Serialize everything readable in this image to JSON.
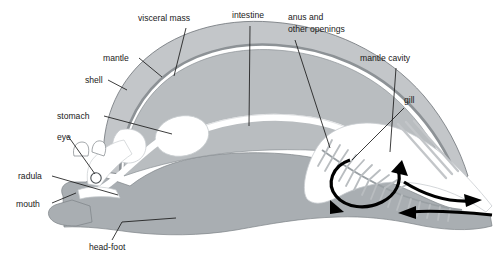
{
  "diagram": {
    "background_color": "#ffffff",
    "colors": {
      "shell": "#c3c6c9",
      "mantle_line": "#8d9296",
      "visceral_mass": "#b9bdc0",
      "body": "#a9aeb2",
      "cavity_white": "#ffffff",
      "outline": "#6f7478",
      "label_text": "#1a1a1a",
      "arrow": "#000000",
      "gill_filament": "#b9bdc0"
    },
    "labels": [
      {
        "id": "visceral-mass",
        "text": "visceral mass",
        "x": 138,
        "y": 21
      },
      {
        "id": "intestine",
        "text": "intestine",
        "x": 232,
        "y": 18
      },
      {
        "id": "anus",
        "text": "anus and",
        "x": 288,
        "y": 20
      },
      {
        "id": "anus2",
        "text": "other openings",
        "x": 288,
        "y": 32
      },
      {
        "id": "mantle-cavity",
        "text": "mantle cavity",
        "x": 360,
        "y": 61
      },
      {
        "id": "mantle",
        "text": "mantle",
        "x": 103,
        "y": 61
      },
      {
        "id": "shell",
        "text": "shell",
        "x": 85,
        "y": 83
      },
      {
        "id": "stomach",
        "text": "stomach",
        "x": 57,
        "y": 119
      },
      {
        "id": "gill",
        "text": "gill",
        "x": 404,
        "y": 103
      },
      {
        "id": "eye",
        "text": "eye",
        "x": 57,
        "y": 140
      },
      {
        "id": "radula",
        "text": "radula",
        "x": 18,
        "y": 179
      },
      {
        "id": "mouth",
        "text": "mouth",
        "x": 16,
        "y": 207
      },
      {
        "id": "head-foot",
        "text": "head-foot",
        "x": 89,
        "y": 250
      }
    ],
    "flow_arrows": [
      {
        "id": "gill-circulation",
        "direction": "clockwise-loop"
      },
      {
        "id": "exhalant-current",
        "direction": "rightward-out"
      },
      {
        "id": "inhalant-current",
        "direction": "leftward-in"
      }
    ]
  }
}
